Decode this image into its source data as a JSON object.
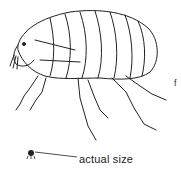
{
  "figure": {
    "caption": "actual size",
    "stray_mark": "f",
    "line_color": "#222222",
    "background": "#ffffff"
  }
}
